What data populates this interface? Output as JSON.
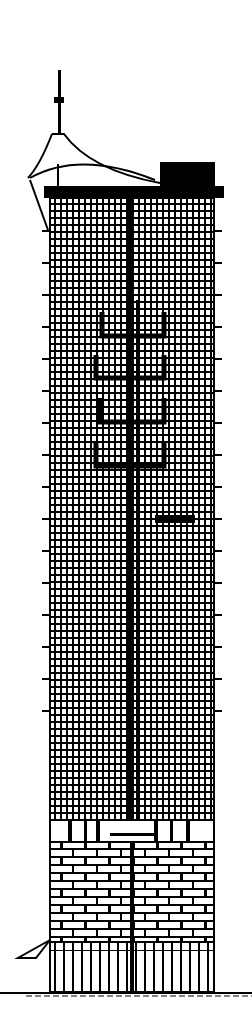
{
  "drawing": {
    "type": "architectural-elevation",
    "subject": "skyscraper tower",
    "colors": {
      "ink": "#000000",
      "paper": "#ffffff"
    },
    "width": 252,
    "height": 1022
  }
}
